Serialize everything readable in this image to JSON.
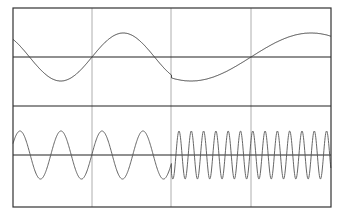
{
  "chart_data": [
    {
      "type": "line",
      "title": "",
      "panel": "top",
      "xlabel": "",
      "ylabel": "",
      "grid": true,
      "legend": null,
      "description": "Sine wave at low frequency; phase discontinuity at the midpoint, then a slower sine",
      "segments": [
        {
          "x_range": [
            0,
            0.5
          ],
          "cycles": 1.25,
          "amplitude": 1.0,
          "start_phase_deg": 150,
          "start_value": 0.7
        },
        {
          "x_range": [
            0.5,
            1.0
          ],
          "cycles": 0.55,
          "amplitude": 1.0,
          "start_value": -0.95,
          "end_value": 0.9
        }
      ],
      "ylim": [
        -1.0,
        1.0
      ]
    },
    {
      "type": "line",
      "title": "",
      "panel": "bottom",
      "xlabel": "",
      "ylabel": "",
      "grid": true,
      "legend": null,
      "description": "Sine wave ~3.8 cycles in first half, then ~13 cycles in second half (frequency shift)",
      "segments": [
        {
          "x_range": [
            0,
            0.5
          ],
          "cycles": 3.85,
          "amplitude": 1.0,
          "start_value": 0.5
        },
        {
          "x_range": [
            0.5,
            1.0
          ],
          "cycles": 12.9,
          "amplitude": 1.0
        }
      ],
      "ylim": [
        -1.0,
        1.0
      ]
    }
  ],
  "colors": {
    "background": "#ffffff",
    "frame": "#333333",
    "grid": "#999999",
    "axis": "#222222",
    "trace": "#444444"
  },
  "layout": {
    "frame": {
      "left": 13,
      "top": 8,
      "right": 331,
      "bottom": 207
    },
    "vgrid_x": [
      92,
      171,
      251
    ],
    "panel_separator_y": 106,
    "top_axis_y": 57,
    "bottom_axis_y": 155,
    "top_amp_px": 24,
    "bottom_amp_px": 24
  }
}
